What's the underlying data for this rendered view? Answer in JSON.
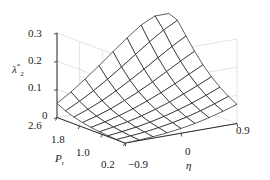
{
  "figure": {
    "type": "3d-surface-plot",
    "background_color": "#ffffff",
    "line_color": "#1a1a1a",
    "panel_grid_color": "#c8c8c8"
  },
  "axes": {
    "z": {
      "label": "λ",
      "label_sub": "2",
      "label_sup": "*",
      "ticks": [
        "0.3",
        "0.2",
        "0.1",
        "0"
      ],
      "values": [
        0.3,
        0.2,
        0.1,
        0.0
      ],
      "range": [
        0,
        0.3
      ]
    },
    "x": {
      "label": "P",
      "label_sub": "r",
      "ticks": [
        "2.6",
        "1.8",
        "1.0",
        "0.2"
      ],
      "values": [
        2.6,
        1.8,
        1.0,
        0.2
      ],
      "range": [
        0.2,
        2.6
      ]
    },
    "y": {
      "label": "η",
      "ticks": [
        "−0.9",
        "0",
        "0.9"
      ],
      "values": [
        -0.9,
        0,
        0.9
      ],
      "range": [
        -0.9,
        0.9
      ]
    }
  },
  "chart_data": {
    "type": "surface",
    "title": "",
    "xlabel": "P_r",
    "ylabel": "η",
    "zlabel": "λ_2^*",
    "grid": true,
    "legend": false,
    "xlim": [
      0.2,
      2.6
    ],
    "ylim": [
      -0.9,
      0.9
    ],
    "zlim": [
      0,
      0.3
    ],
    "x": [
      0.2,
      0.5,
      0.8,
      1.1,
      1.4,
      1.7,
      2.0,
      2.3,
      2.6
    ],
    "y": [
      -0.9,
      -0.675,
      -0.45,
      -0.225,
      0,
      0.225,
      0.45,
      0.675,
      0.9
    ],
    "z": [
      [
        0.0,
        0.001,
        0.003,
        0.006,
        0.01,
        0.016,
        0.024,
        0.035,
        0.05
      ],
      [
        0.002,
        0.005,
        0.009,
        0.014,
        0.021,
        0.03,
        0.043,
        0.06,
        0.082
      ],
      [
        0.005,
        0.01,
        0.016,
        0.024,
        0.034,
        0.047,
        0.065,
        0.089,
        0.119
      ],
      [
        0.01,
        0.017,
        0.025,
        0.036,
        0.05,
        0.068,
        0.091,
        0.121,
        0.158
      ],
      [
        0.017,
        0.026,
        0.037,
        0.051,
        0.069,
        0.091,
        0.12,
        0.156,
        0.199
      ],
      [
        0.026,
        0.037,
        0.051,
        0.068,
        0.09,
        0.117,
        0.151,
        0.192,
        0.239
      ],
      [
        0.038,
        0.051,
        0.067,
        0.088,
        0.113,
        0.145,
        0.183,
        0.228,
        0.276
      ],
      [
        0.052,
        0.067,
        0.086,
        0.109,
        0.138,
        0.173,
        0.214,
        0.261,
        0.3
      ],
      [
        0.068,
        0.085,
        0.106,
        0.132,
        0.163,
        0.2,
        0.243,
        0.287,
        0.3
      ]
    ]
  }
}
